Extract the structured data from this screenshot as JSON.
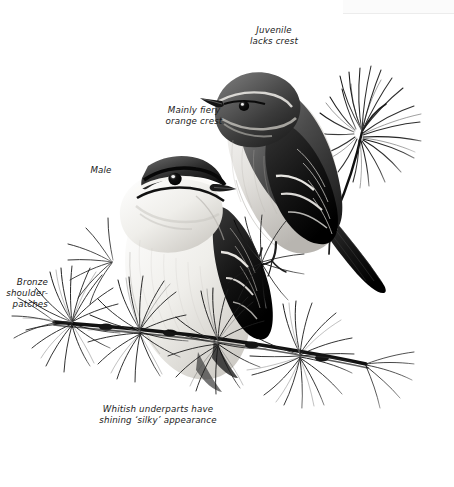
{
  "plate": {
    "title": "Firecrest field-guide plate",
    "medium": "monochrome pen-and-ink / pencil illustration",
    "background_color": "#ffffff",
    "ink_color": "#111111",
    "width": 454,
    "height": 487
  },
  "labels": {
    "juvenile": "Juvenile\nlacks crest",
    "crest": "Mainly fiery\norange crest",
    "male": "Male",
    "bronze": "Bronze\nshoulder-\npatches",
    "underparts": "Whitish underparts have\nshining ‘silky’ appearance"
  },
  "subjects": [
    {
      "name": "juvenile-bird",
      "position": "upper-right",
      "description": "Juvenile perched upright on pine twig, plain head without crest stripe, dark wings with pale double wingbar, long dark tail angled down-right"
    },
    {
      "name": "male-bird",
      "position": "lower-left",
      "description": "Adult male with bold black lateral crown stripes and pale supercilium, whitish silky underparts, perched on pine branch"
    }
  ],
  "foliage": [
    {
      "name": "pine-sprig-upper-right",
      "description": "radiating cluster of long pine needles behind juvenile"
    },
    {
      "name": "pine-branch-main",
      "description": "horizontal pine branch crossing lower half with four needle whorls"
    },
    {
      "name": "pine-sprig-left",
      "description": "needle whorl at left below the male bird"
    }
  ]
}
